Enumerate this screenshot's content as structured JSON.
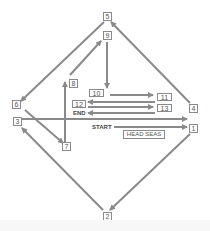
{
  "diagram": {
    "type": "maneuver-path",
    "waypoints": [
      {
        "id": "1",
        "label": "1"
      },
      {
        "id": "2",
        "label": "2"
      },
      {
        "id": "3",
        "label": "3"
      },
      {
        "id": "4",
        "label": "4"
      },
      {
        "id": "5",
        "label": "5"
      },
      {
        "id": "6",
        "label": "6"
      },
      {
        "id": "7",
        "label": "7"
      },
      {
        "id": "8",
        "label": "8"
      },
      {
        "id": "9",
        "label": "9"
      },
      {
        "id": "10",
        "label": "10"
      },
      {
        "id": "11",
        "label": "11"
      },
      {
        "id": "12",
        "label": "12"
      },
      {
        "id": "13",
        "label": "13"
      }
    ],
    "start_label": "START",
    "end_label": "END",
    "head_seas_label": "HEAD SEAS",
    "arrow_color": "#8a8a8a"
  }
}
